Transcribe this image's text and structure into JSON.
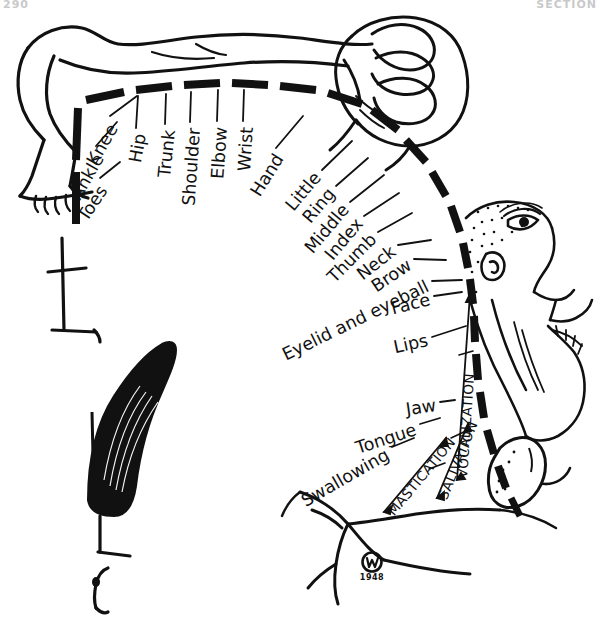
{
  "page": {
    "header_left": "290",
    "header_right": "SECTION",
    "width": 603,
    "height": 628,
    "background": "#ffffff",
    "ink": "#111111"
  },
  "figure": {
    "name": "sensory-homunculus",
    "signature_initials": "W",
    "signature_year": "1948"
  },
  "labels": {
    "body_upper": [
      {
        "id": "toes",
        "text": "Toes"
      },
      {
        "id": "ankle",
        "text": "Ankle"
      },
      {
        "id": "knee",
        "text": "Knee"
      },
      {
        "id": "hip",
        "text": "Hip"
      },
      {
        "id": "trunk",
        "text": "Trunk"
      },
      {
        "id": "shoulder",
        "text": "Shoulder"
      },
      {
        "id": "elbow",
        "text": "Elbow"
      },
      {
        "id": "wrist",
        "text": "Wrist"
      },
      {
        "id": "hand",
        "text": "Hand"
      }
    ],
    "digits_face": [
      {
        "id": "little",
        "text": "Little"
      },
      {
        "id": "ring",
        "text": "Ring"
      },
      {
        "id": "middle",
        "text": "Middle"
      },
      {
        "id": "index",
        "text": "Index"
      },
      {
        "id": "thumb",
        "text": "Thumb"
      },
      {
        "id": "neck",
        "text": "Neck"
      },
      {
        "id": "brow",
        "text": "Brow"
      },
      {
        "id": "eyelid_eyeball",
        "text": "Eyelid and eyeball"
      },
      {
        "id": "face",
        "text": "Face"
      },
      {
        "id": "lips",
        "text": "Lips"
      }
    ],
    "oral": [
      {
        "id": "jaw",
        "text": "Jaw"
      },
      {
        "id": "tongue",
        "text": "Tongue"
      },
      {
        "id": "swallowing",
        "text": "Swallowing"
      }
    ],
    "functions": [
      {
        "id": "mastication",
        "text": "MASTICATION"
      },
      {
        "id": "salivation",
        "text": "SALIVATION"
      },
      {
        "id": "vocalization",
        "text": "VOCALIZATION"
      }
    ]
  }
}
